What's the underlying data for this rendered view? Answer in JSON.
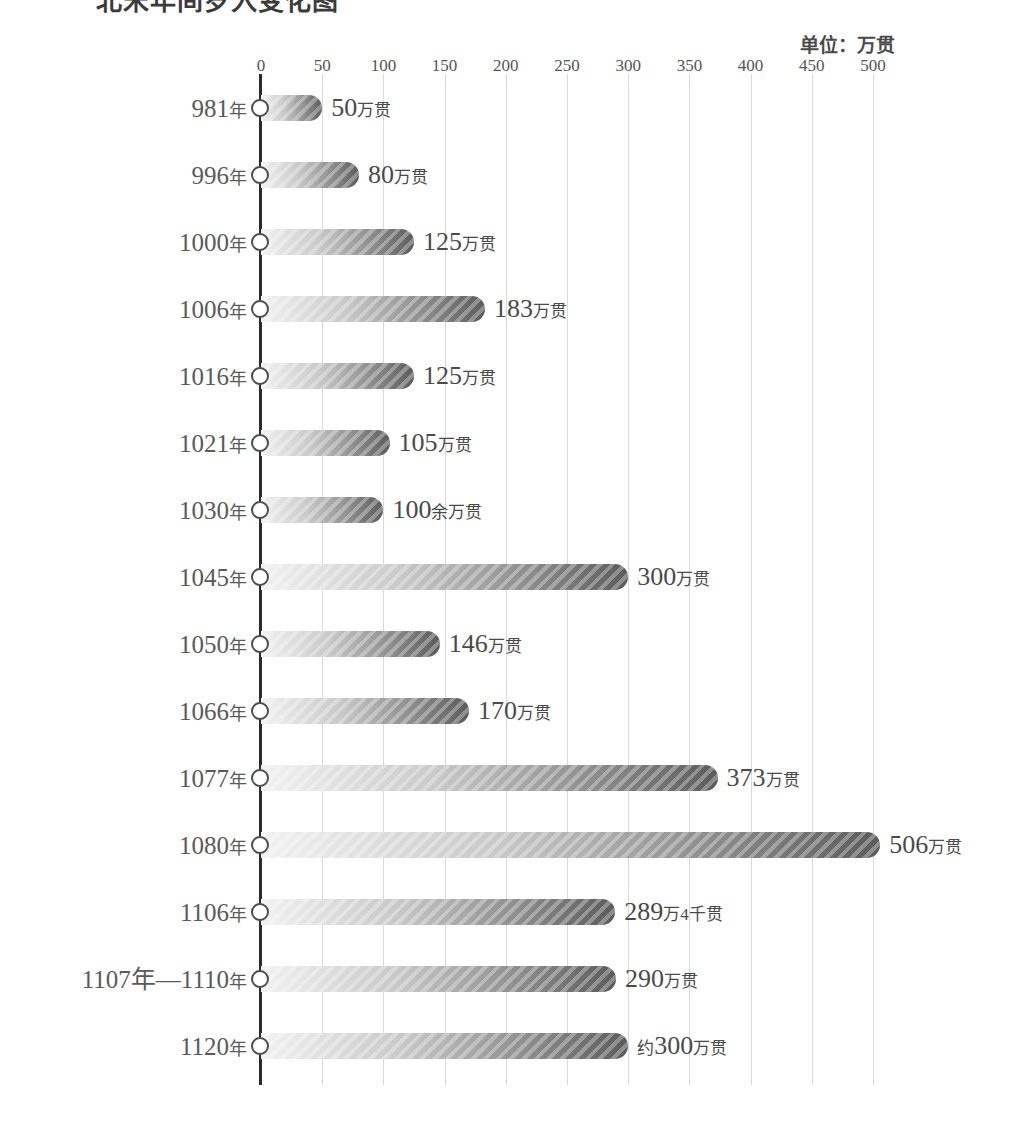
{
  "title": "北宋年间岁入变化图",
  "unit_caption": "单位：万贯",
  "axis": {
    "ticks": [
      0,
      50,
      100,
      150,
      200,
      250,
      300,
      350,
      400,
      450,
      500
    ],
    "min": 0,
    "max": 500
  },
  "chart_data": {
    "type": "bar",
    "orientation": "horizontal",
    "title": "北宋年间岁入变化图",
    "xlabel": "",
    "ylabel": "",
    "unit": "万贯",
    "unit_caption": "单位：万贯",
    "xlim": [
      0,
      500
    ],
    "xticks": [
      0,
      50,
      100,
      150,
      200,
      250,
      300,
      350,
      400,
      450,
      500
    ],
    "grid": true,
    "legend": false,
    "categories": [
      "981年",
      "996年",
      "1000年",
      "1006年",
      "1016年",
      "1021年",
      "1030年",
      "1045年",
      "1050年",
      "1066年",
      "1077年",
      "1080年",
      "1106年",
      "1107年—1110年",
      "1120年"
    ],
    "values": [
      50,
      80,
      125,
      183,
      125,
      105,
      100,
      300,
      146,
      170,
      373,
      506,
      289.4,
      290,
      300
    ],
    "data_labels": [
      "50万贯",
      "80万贯",
      "125万贯",
      "183万贯",
      "125万贯",
      "105万贯",
      "100余万贯",
      "300万贯",
      "146万贯",
      "170万贯",
      "373万贯",
      "506万贯",
      "289万4千贯",
      "290万贯",
      "约300万贯"
    ]
  },
  "rows": [
    {
      "year_num": "981",
      "year_cjk": "年",
      "value": 50,
      "num": "50",
      "pre": "",
      "suffix": "万贯"
    },
    {
      "year_num": "996",
      "year_cjk": "年",
      "value": 80,
      "num": "80",
      "pre": "",
      "suffix": "万贯"
    },
    {
      "year_num": "1000",
      "year_cjk": "年",
      "value": 125,
      "num": "125",
      "pre": "",
      "suffix": "万贯"
    },
    {
      "year_num": "1006",
      "year_cjk": "年",
      "value": 183,
      "num": "183",
      "pre": "",
      "suffix": "万贯"
    },
    {
      "year_num": "1016",
      "year_cjk": "年",
      "value": 125,
      "num": "125",
      "pre": "",
      "suffix": "万贯"
    },
    {
      "year_num": "1021",
      "year_cjk": "年",
      "value": 105,
      "num": "105",
      "pre": "",
      "suffix": "万贯"
    },
    {
      "year_num": "1030",
      "year_cjk": "年",
      "value": 100,
      "num": "100",
      "pre": "",
      "suffix": "余万贯"
    },
    {
      "year_num": "1045",
      "year_cjk": "年",
      "value": 300,
      "num": "300",
      "pre": "",
      "suffix": "万贯"
    },
    {
      "year_num": "1050",
      "year_cjk": "年",
      "value": 146,
      "num": "146",
      "pre": "",
      "suffix": "万贯"
    },
    {
      "year_num": "1066",
      "year_cjk": "年",
      "value": 170,
      "num": "170",
      "pre": "",
      "suffix": "万贯"
    },
    {
      "year_num": "1077",
      "year_cjk": "年",
      "value": 373,
      "num": "373",
      "pre": "",
      "suffix": "万贯"
    },
    {
      "year_num": "1080",
      "year_cjk": "年",
      "value": 506,
      "num": "506",
      "pre": "",
      "suffix": "万贯"
    },
    {
      "year_num": "1106",
      "year_cjk": "年",
      "value": 289.4,
      "num": "289",
      "pre": "",
      "suffix": "万4千贯"
    },
    {
      "year_num": "1107年—1110",
      "year_cjk": "年",
      "value": 290,
      "num": "290",
      "pre": "",
      "suffix": "万贯"
    },
    {
      "year_num": "1120",
      "year_cjk": "年",
      "value": 300,
      "num": "300",
      "pre": "约",
      "suffix": "万贯"
    }
  ],
  "geometry": {
    "axis_x": 261,
    "px_per_unit": 1.224,
    "first_row_center": 108,
    "row_spacing": 67
  }
}
